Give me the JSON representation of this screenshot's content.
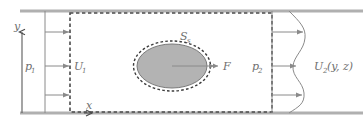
{
  "figure": {
    "type": "diagram",
    "labels": {
      "y_axis": "y",
      "x_axis": "x",
      "inlet_pressure": "p",
      "inlet_pressure_sub": "1",
      "inlet_velocity": "U",
      "inlet_velocity_sub": "1",
      "body_surface": "S",
      "body_surface_sub": "s",
      "force": "F",
      "outlet_pressure": "p",
      "outlet_pressure_sub": "2",
      "outlet_velocity": "U",
      "outlet_velocity_sub": "2",
      "outlet_velocity_args": "(y, z)"
    },
    "colors": {
      "wall": "#b0b0b0",
      "line": "#8a8a8a",
      "dashed": "#4a4a4a",
      "body_fill": "#b3b3b3",
      "body_stroke": "#7a7a7a",
      "text": "#6f6f6f",
      "background": "#ffffff"
    },
    "geometry": {
      "wall_top_y": 11,
      "wall_bottom_y": 113,
      "wall_x_start": 20,
      "wall_x_end": 363,
      "cv_left_x": 70,
      "cv_right_x": 272,
      "cv_top_y": 13,
      "cv_bottom_y": 112,
      "inlet_station_x": 45,
      "outlet_station_x": 272,
      "body_center_x": 172,
      "body_center_y": 66,
      "body_rx": 36,
      "body_ry": 23
    },
    "inlet_profile": {
      "kind": "uniform",
      "arrow_y": [
        32,
        66,
        95
      ],
      "arrow_lengths": [
        25,
        25,
        25
      ]
    },
    "outlet_profile": {
      "kind": "nonuniform-s-curve",
      "arrow_y": [
        32,
        66,
        95
      ],
      "arrow_lengths": [
        33,
        26,
        32
      ]
    }
  }
}
